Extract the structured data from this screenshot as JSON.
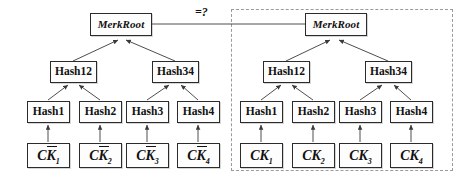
{
  "figure": {
    "comparison_label": "=?",
    "colors": {
      "node_border": "#2b2b2b",
      "node_fill": "#fdfdfd",
      "edge": "#3a3a3a",
      "dashed_boundary": "#9a9a9a",
      "text": "#111111"
    }
  },
  "left_tree": {
    "root": {
      "label": "MerkRoot"
    },
    "level2": [
      {
        "label": "Hash12"
      },
      {
        "label": "Hash34"
      }
    ],
    "level3": [
      {
        "label": "Hash1"
      },
      {
        "label": "Hash2"
      },
      {
        "label": "Hash3"
      },
      {
        "label": "Hash4"
      }
    ],
    "leaves": [
      {
        "prefix": "C",
        "base": "K",
        "overbar": true,
        "subscript": "1"
      },
      {
        "prefix": "C",
        "base": "K",
        "overbar": true,
        "subscript": "2"
      },
      {
        "prefix": "C",
        "base": "K",
        "overbar": true,
        "subscript": "3"
      },
      {
        "prefix": "C",
        "base": "K",
        "overbar": true,
        "subscript": "4"
      }
    ]
  },
  "right_tree": {
    "root": {
      "label": "MerkRoot"
    },
    "level2": [
      {
        "label": "Hash12"
      },
      {
        "label": "Hash34"
      }
    ],
    "level3": [
      {
        "label": "Hash1"
      },
      {
        "label": "Hash2"
      },
      {
        "label": "Hash3"
      },
      {
        "label": "Hash4"
      }
    ],
    "leaves": [
      {
        "prefix": "C",
        "base": "K",
        "overbar": false,
        "subscript": "1"
      },
      {
        "prefix": "C",
        "base": "K",
        "overbar": false,
        "subscript": "2"
      },
      {
        "prefix": "C",
        "base": "K",
        "overbar": false,
        "subscript": "3"
      },
      {
        "prefix": "C",
        "base": "K",
        "overbar": false,
        "subscript": "4"
      }
    ]
  }
}
